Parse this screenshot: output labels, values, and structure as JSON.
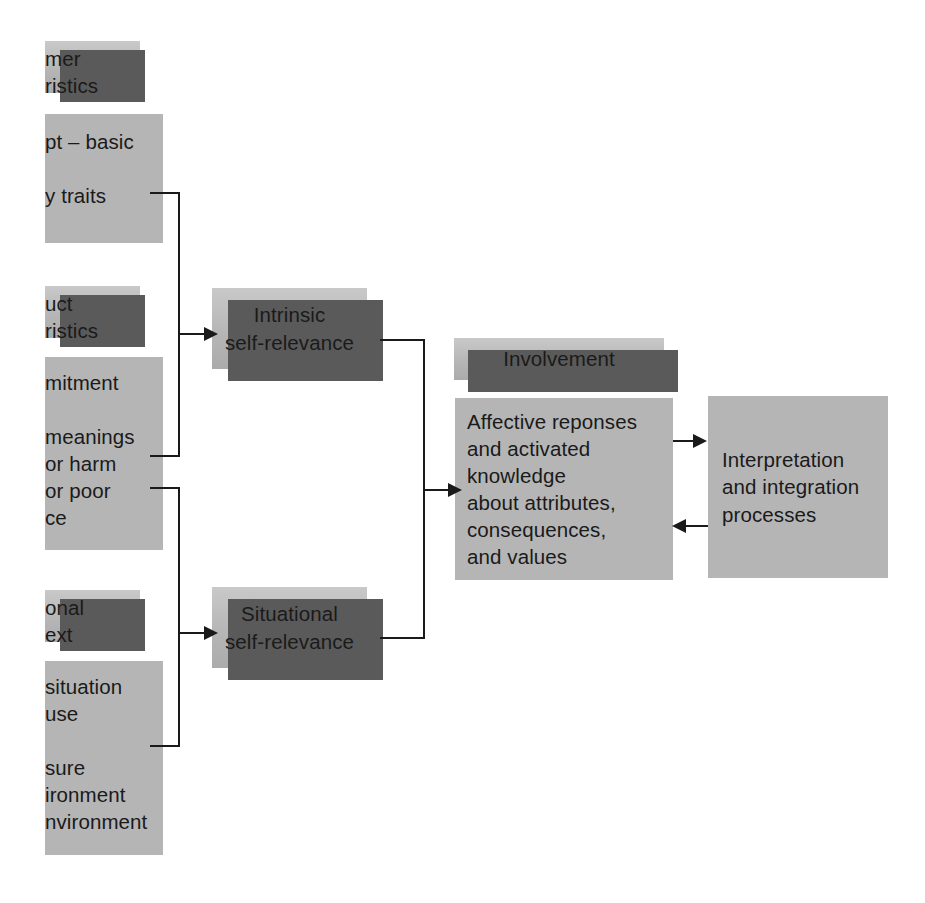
{
  "diagram": {
    "colors": {
      "box_fill": "#b8b8b8",
      "box_shadow": "#5a5a5a",
      "connector": "#1a1a1a",
      "background": "#ffffff"
    },
    "boxes": {
      "consumer_characteristics_header": "mer\nristics",
      "consumer_characteristics_body": "pt – basic\n\ny traits",
      "product_characteristics_header": "uct\nristics",
      "product_characteristics_body": "mitment\n\nmeanings\nor harm\nor poor\nce",
      "situational_context_header": "onal\next",
      "situational_context_body": "situation\nuse\n\nsure\nironment\nnvironment",
      "intrinsic_self_relevance": "Intrinsic\nself-relevance",
      "situational_self_relevance": "Situational\nself-relevance",
      "involvement_header": "Involvement",
      "affective_responses": "Affective reponses\nand activated\nknowledge\nabout attributes,\nconsequences,\nand values",
      "interpretation_processes": "Interpretation\nand integration\nprocesses"
    },
    "connectors": [
      {
        "name": "consumer-to-intrinsic",
        "from": "consumer_characteristics_body",
        "to": "intrinsic_self_relevance"
      },
      {
        "name": "product-to-intrinsic",
        "from": "product_characteristics_body",
        "to": "intrinsic_self_relevance"
      },
      {
        "name": "product-to-situational",
        "from": "product_characteristics_body",
        "to": "situational_self_relevance"
      },
      {
        "name": "situational-context-to-situational",
        "from": "situational_context_body",
        "to": "situational_self_relevance"
      },
      {
        "name": "intrinsic-to-affective",
        "from": "intrinsic_self_relevance",
        "to": "affective_responses"
      },
      {
        "name": "situational-to-affective",
        "from": "situational_self_relevance",
        "to": "affective_responses"
      },
      {
        "name": "affective-to-interpretation",
        "from": "affective_responses",
        "to": "interpretation_processes"
      },
      {
        "name": "interpretation-to-affective",
        "from": "interpretation_processes",
        "to": "affective_responses"
      }
    ]
  }
}
